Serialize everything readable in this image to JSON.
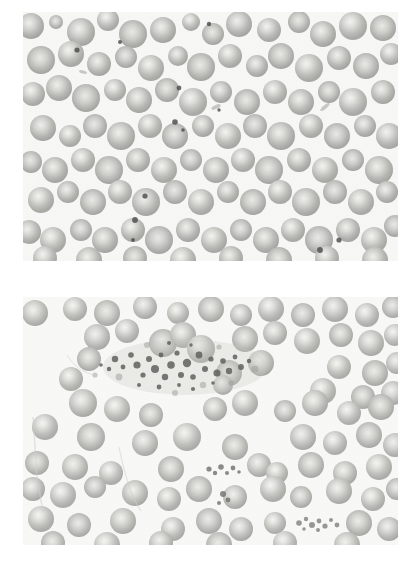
{
  "figure": {
    "title": "Peripheral blood smear light micrographs",
    "panel_count": 2,
    "background_color": "#ffffff",
    "field_background_color": "#f8f8f6",
    "stain_note": "grayscale / unstained appearance",
    "modality_icon": "microscope-icon"
  },
  "panels": [
    {
      "id": "panel-top",
      "label": "",
      "x": 23,
      "y": 12,
      "width": 375,
      "height": 249,
      "content_description": "Dense monolayer of normochromic normocytic red blood cells with central pallor; scattered small dark punctate platelets",
      "cell_fill_color": "#b9b9b5",
      "cell_edge_color": "#9a9a96",
      "cell_pallor_color": "#ededea",
      "platelet_color": "#4a4a48",
      "cell_count": 118,
      "platelet_count": 12
    },
    {
      "id": "panel-bottom",
      "label": "",
      "x": 23,
      "y": 297,
      "width": 375,
      "height": 248,
      "content_description": "Red blood cells more loosely spaced with a large central platelet aggregate (clump) and two smaller platelet clumps",
      "cell_fill_color": "#bdbdb9",
      "cell_edge_color": "#9e9e9a",
      "cell_pallor_color": "#efefed",
      "platelet_color": "#585856",
      "cell_count": 92,
      "clump_count": 3,
      "clumps": [
        {
          "name": "large-platelet-aggregate",
          "cx": 165,
          "cy": 70,
          "rx": 80,
          "ry": 30
        },
        {
          "name": "small-platelet-aggregate-mid",
          "cx": 195,
          "cy": 175,
          "rx": 20,
          "ry": 10
        },
        {
          "name": "small-platelet-aggregate-lower",
          "cx": 295,
          "cy": 225,
          "rx": 24,
          "ry": 9
        }
      ]
    }
  ]
}
